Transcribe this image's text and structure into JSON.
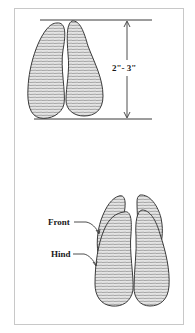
{
  "figure": {
    "top_view": {
      "description": "deer hoof track, two toes",
      "dimension_label": "2\"- 3\""
    },
    "bottom_view": {
      "description": "overlapping front and hind tracks",
      "labels": {
        "front": "Front",
        "hind": "Hind"
      }
    },
    "colors": {
      "outline": "#3a3a3a",
      "fill": "#d9d9d9",
      "hatch": "#8a8a8a",
      "frame": "#c8c8c8"
    }
  }
}
